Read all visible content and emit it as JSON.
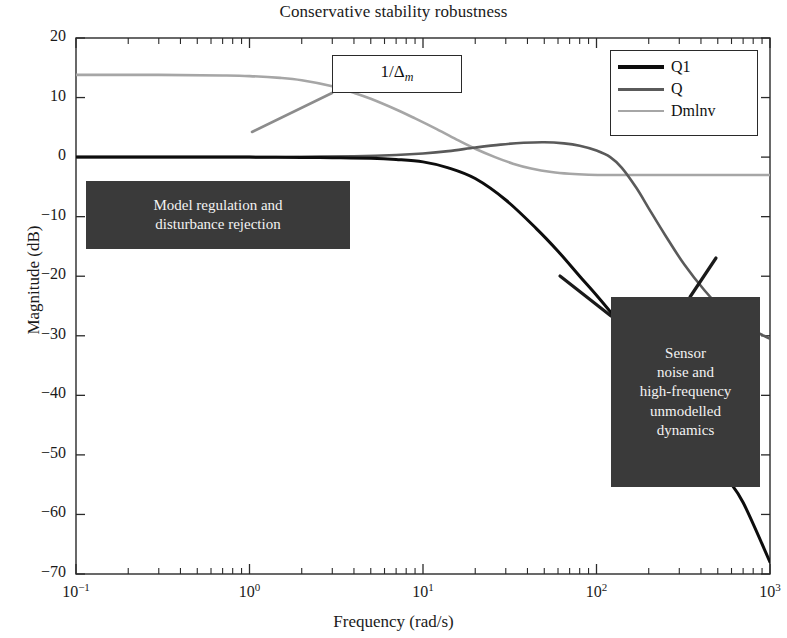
{
  "chart_data": {
    "type": "line",
    "title": "Conservative stability robustness",
    "xlabel": "Frequency (rad/s)",
    "ylabel": "Magnitude (dB)",
    "xscale": "log",
    "xlim": [
      0.1,
      1000
    ],
    "ylim": [
      -70,
      20
    ],
    "grid": false,
    "legend_position": "top-right",
    "xticks": [
      {
        "value": 0.1,
        "label": "10",
        "exp": "−1"
      },
      {
        "value": 1,
        "label": "10",
        "exp": "0"
      },
      {
        "value": 10,
        "label": "10",
        "exp": "1"
      },
      {
        "value": 100,
        "label": "10",
        "exp": "2"
      },
      {
        "value": 1000,
        "label": "10",
        "exp": "3"
      }
    ],
    "yticks": [
      20,
      10,
      0,
      -10,
      -20,
      -30,
      -40,
      -50,
      -60,
      -70
    ],
    "ytick_labels": [
      "20",
      "10",
      "0",
      "−10",
      "−20",
      "−30",
      "−40",
      "−50",
      "−60",
      "−70"
    ],
    "series": [
      {
        "name": "Q1",
        "color": "#0d0d0d",
        "width": 3.0,
        "x": [
          0.1,
          0.2,
          0.4,
          0.7,
          1,
          2,
          3,
          5,
          7,
          10,
          14,
          20,
          30,
          45,
          60,
          80,
          100,
          130,
          170,
          220,
          300,
          400,
          550,
          700,
          1000
        ],
        "y": [
          0.0,
          0.0,
          0.0,
          0.0,
          0.0,
          -0.05,
          -0.1,
          -0.2,
          -0.4,
          -0.8,
          -1.8,
          -3.6,
          -7.2,
          -12.0,
          -15.8,
          -20.0,
          -23.2,
          -27.2,
          -31.6,
          -36.0,
          -42.0,
          -47.2,
          -53.4,
          -58.0,
          -68.0
        ]
      },
      {
        "name": "Q",
        "color": "#5a5a5a",
        "width": 2.6,
        "x": [
          0.1,
          0.3,
          1,
          2,
          4,
          7,
          10,
          14,
          20,
          28,
          38,
          50,
          65,
          80,
          100,
          120,
          140,
          170,
          200,
          250,
          320,
          420,
          550,
          700,
          1000
        ],
        "y": [
          0.0,
          0.0,
          0.0,
          0.05,
          0.15,
          0.35,
          0.6,
          1.0,
          1.6,
          2.1,
          2.4,
          2.5,
          2.3,
          1.9,
          1.1,
          0.0,
          -1.8,
          -5.2,
          -8.6,
          -13.2,
          -18.0,
          -22.4,
          -26.0,
          -28.2,
          -30.5
        ]
      },
      {
        "name": "Dmlnv",
        "color": "#a6a6a6",
        "width": 2.6,
        "x": [
          0.1,
          0.3,
          0.7,
          1,
          1.5,
          2,
          3,
          4,
          5,
          7,
          9,
          12,
          16,
          20,
          26,
          33,
          42,
          55,
          70,
          90,
          120,
          180,
          300,
          600,
          1000
        ],
        "y": [
          13.8,
          13.8,
          13.7,
          13.6,
          13.3,
          12.9,
          11.9,
          10.8,
          9.8,
          8.0,
          6.5,
          4.7,
          2.8,
          1.4,
          0.0,
          -1.1,
          -1.9,
          -2.5,
          -2.8,
          -2.95,
          -3.0,
          -3.0,
          -3.0,
          -3.0,
          -3.0
        ]
      }
    ],
    "annotations": [
      {
        "name": "delta-m-label",
        "text": "1/Δ",
        "sub": "m",
        "style": "light-box"
      },
      {
        "name": "low-frequency-note",
        "lines": [
          "Model regulation and",
          "disturbance rejection"
        ],
        "style": "dark-box"
      },
      {
        "name": "high-frequency-note",
        "lines": [
          "Sensor",
          "noise and",
          "high-frequency",
          "unmodelled",
          "dynamics"
        ],
        "style": "dark-box"
      }
    ]
  },
  "legend": {
    "items": [
      {
        "label": "Q1",
        "color": "#0d0d0d",
        "width": 4.0
      },
      {
        "label": "Q",
        "color": "#5a5a5a",
        "width": 3.4
      },
      {
        "label": "Dmlnv",
        "color": "#a6a6a6",
        "width": 2.6
      }
    ]
  },
  "colors": {
    "axis": "#2a2a2a",
    "background": "#ffffff",
    "annotation_dark_bg": "#3a3a3a",
    "annotation_dark_text": "#f2f2f2"
  }
}
